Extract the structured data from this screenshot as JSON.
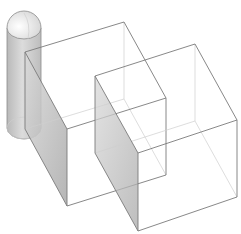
{
  "scene": {
    "title": "Isometric wireframe: cylinder and two cubes",
    "background": "#ffffff",
    "colors": {
      "edge": "#7a7a7a",
      "hidden_edge": "#cfcfcf",
      "shade_dark": "#a8a8a8",
      "shade_light": "#d6d6d6"
    },
    "objects": [
      {
        "type": "cylinder",
        "name": "cylinder",
        "cx": 24,
        "top_y": 28,
        "bottom_y": 128,
        "rx": 17,
        "ry": 11
      },
      {
        "type": "cube",
        "name": "cube-back",
        "top": [
          [
            25,
            52
          ],
          [
            124,
            22
          ],
          [
            166,
            98
          ],
          [
            67,
            129
          ]
        ],
        "bottom": [
          [
            25,
            129
          ],
          [
            124,
            99
          ],
          [
            166,
            175
          ],
          [
            67,
            206
          ]
        ]
      },
      {
        "type": "cube",
        "name": "cube-front",
        "top": [
          [
            95,
            76
          ],
          [
            195,
            44
          ],
          [
            237,
            120
          ],
          [
            138,
            153
          ]
        ],
        "bottom": [
          [
            95,
            153
          ],
          [
            195,
            121
          ],
          [
            237,
            197
          ],
          [
            138,
            231
          ]
        ]
      }
    ]
  }
}
